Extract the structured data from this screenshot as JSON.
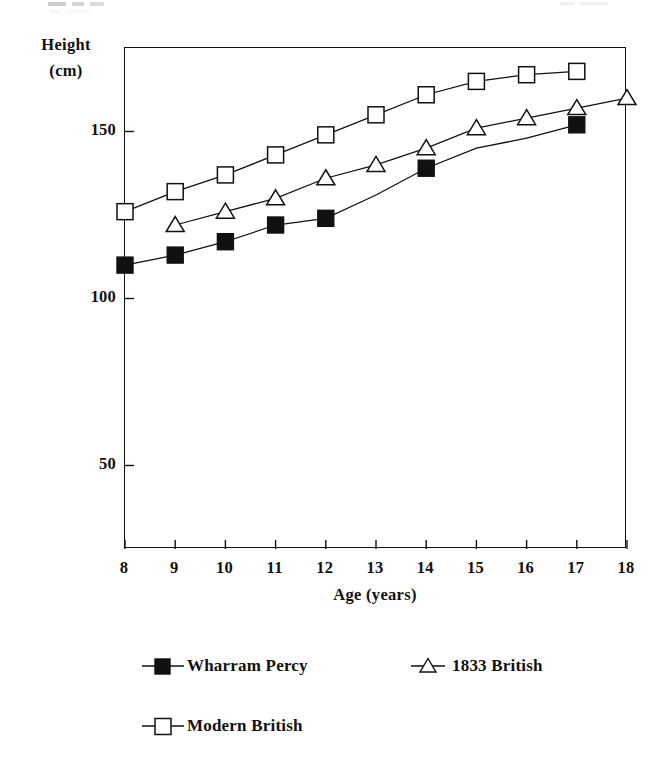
{
  "chart_data": {
    "type": "line",
    "title": "",
    "xlabel": "Age (years)",
    "ylabel": "Height (cm)",
    "x": [
      8,
      9,
      10,
      11,
      12,
      13,
      14,
      15,
      16,
      17,
      18
    ],
    "xlim": [
      8,
      18
    ],
    "ylim": [
      25,
      175
    ],
    "xticks": [
      "8",
      "9",
      "10",
      "11",
      "12",
      "13",
      "14",
      "15",
      "16",
      "17",
      "18"
    ],
    "yticks": [
      "50",
      "100",
      "150"
    ],
    "ytick_values": [
      50,
      100,
      150
    ],
    "grid": false,
    "legend_position": "below-plot",
    "series": [
      {
        "name": "Wharram Percy",
        "marker": "filled-square",
        "x": [
          8,
          9,
          10,
          11,
          12,
          13,
          14,
          15,
          16,
          17
        ],
        "values": [
          110,
          113,
          117,
          122,
          124,
          131,
          139,
          145,
          148,
          152
        ],
        "markers_at": [
          8,
          9,
          10,
          11,
          12,
          14,
          17
        ]
      },
      {
        "name": "1833 British",
        "marker": "open-triangle",
        "x": [
          9,
          10,
          11,
          12,
          13,
          14,
          15,
          16,
          17,
          18
        ],
        "values": [
          122,
          126,
          130,
          136,
          140,
          145,
          151,
          154,
          157,
          160
        ],
        "markers_at": [
          9,
          10,
          11,
          12,
          13,
          14,
          15,
          16,
          17,
          18
        ]
      },
      {
        "name": "Modern British",
        "marker": "open-square",
        "x": [
          8,
          9,
          10,
          11,
          12,
          13,
          14,
          15,
          16,
          17
        ],
        "values": [
          126,
          132,
          137,
          143,
          149,
          155,
          161,
          165,
          167,
          168
        ],
        "markers_at": [
          8,
          9,
          10,
          11,
          12,
          13,
          14,
          15,
          16,
          17
        ]
      }
    ]
  },
  "axes": {
    "y_title_main": "Height",
    "y_title_unit": "(cm)",
    "x_title": "Age (years)"
  },
  "legend": {
    "entries": [
      {
        "label": "Wharram Percy",
        "marker": "filled-square"
      },
      {
        "label": "1833 British",
        "marker": "open-triangle"
      },
      {
        "label": "Modern British",
        "marker": "open-square"
      }
    ]
  },
  "colors": {
    "ink": "#111111",
    "background": "#ffffff"
  }
}
